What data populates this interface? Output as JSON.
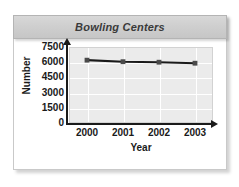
{
  "title": "Bowling Centers",
  "axis": {
    "ylabel": "Number",
    "xlabel": "Year"
  },
  "yticks": [
    "0",
    "1500",
    "3000",
    "4500",
    "6000",
    "7500"
  ],
  "xticks": [
    "2000",
    "2001",
    "2002",
    "2003"
  ],
  "colors": {
    "line": "#1a1a1a",
    "marker": "#4a4a4a",
    "plot_background": "#ebebeb",
    "gridline": "#ffffff",
    "title_bar": "#cfcfcf",
    "title_text": "#3a3a3a",
    "card_background": "#ffffff"
  },
  "chart_data": {
    "type": "line",
    "title": "Bowling Centers",
    "xlabel": "Year",
    "ylabel": "Number",
    "categories": [
      "2000",
      "2001",
      "2002",
      "2003"
    ],
    "values": [
      6200,
      6050,
      6000,
      5900
    ],
    "ylim": [
      0,
      7500
    ],
    "yticks": [
      0,
      1500,
      3000,
      4500,
      6000,
      7500
    ],
    "grid": true,
    "legend": false,
    "series": [
      {
        "name": "Bowling Centers",
        "values": [
          6200,
          6050,
          6000,
          5900
        ]
      }
    ]
  }
}
